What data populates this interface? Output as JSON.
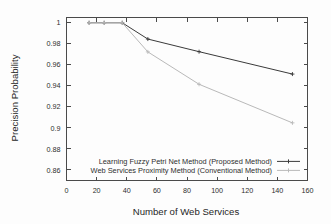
{
  "chart_data": {
    "type": "line",
    "title": "",
    "xlabel": "Number of Web Services",
    "ylabel": "Precision Probability",
    "xlim": [
      0,
      160
    ],
    "ylim": [
      0.85,
      1.005
    ],
    "xticks": [
      0,
      20,
      40,
      60,
      80,
      100,
      120,
      140,
      160
    ],
    "xtick_labels": [
      "0",
      "20",
      "40",
      "60",
      "80",
      "100",
      "120",
      "140",
      "160"
    ],
    "yticks": [
      0.86,
      0.88,
      0.9,
      0.92,
      0.94,
      0.96,
      0.98,
      1
    ],
    "ytick_labels": [
      "0.86",
      "0.88",
      "0.9",
      "0.92",
      "0.94",
      "0.96",
      "0.98",
      "1"
    ],
    "grid": false,
    "legend_position": "inside-bottom-right",
    "series": [
      {
        "name": "Learning Fuzzy Petri Net Method (Proposed Method)",
        "color": "#3a3a3a",
        "x": [
          15,
          25,
          37,
          54,
          88,
          150
        ],
        "values": [
          1.0,
          1.0,
          1.0,
          0.9845,
          0.9725,
          0.9512
        ]
      },
      {
        "name": "Web Services Proximity Method (Conventional Method)",
        "color": "#b9b9b9",
        "x": [
          15,
          25,
          37,
          54,
          88,
          150
        ],
        "values": [
          1.0,
          1.0,
          1.0,
          0.9723,
          0.9415,
          0.9048
        ]
      }
    ]
  },
  "legend": {
    "entries": [
      "Learning Fuzzy Petri Net Method (Proposed Method)",
      "Web Services Proximity Method (Conventional Method)"
    ]
  }
}
